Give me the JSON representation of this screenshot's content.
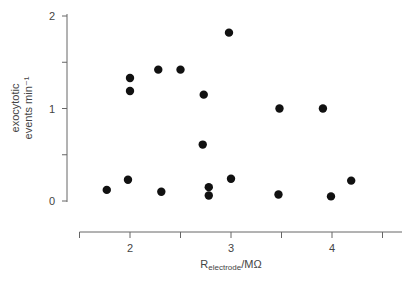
{
  "chart_data": {
    "type": "scatter",
    "title": "",
    "xlabel": "R_electrode/MΩ",
    "xlabel_main": "R",
    "xlabel_sub": "electrode",
    "xlabel_tail": "/MΩ",
    "ylabel": "exocytotic events min⁻¹",
    "ylabel_line1": "exocytotic",
    "ylabel_line2": "events min⁻¹",
    "xlim": [
      1.5,
      4.5
    ],
    "ylim": [
      0,
      2
    ],
    "x_ticks": [
      1.5,
      2,
      2.5,
      3,
      3.5,
      4,
      4.5
    ],
    "x_tick_labels": [
      "",
      "2",
      "",
      "3",
      "",
      "4",
      ""
    ],
    "y_ticks": [
      0,
      0.5,
      1,
      1.5,
      2
    ],
    "y_tick_labels": [
      "0",
      "",
      "1",
      "",
      "2"
    ],
    "grid": false,
    "legend": null,
    "series": [
      {
        "name": "cells",
        "color": "#111111",
        "points": [
          {
            "x": 1.77,
            "y": 0.12
          },
          {
            "x": 1.98,
            "y": 0.23
          },
          {
            "x": 2.0,
            "y": 1.33
          },
          {
            "x": 2.0,
            "y": 1.19
          },
          {
            "x": 2.28,
            "y": 1.42
          },
          {
            "x": 2.31,
            "y": 0.1
          },
          {
            "x": 2.5,
            "y": 1.42
          },
          {
            "x": 2.72,
            "y": 0.61
          },
          {
            "x": 2.73,
            "y": 1.15
          },
          {
            "x": 2.78,
            "y": 0.15
          },
          {
            "x": 2.78,
            "y": 0.06
          },
          {
            "x": 2.98,
            "y": 1.82
          },
          {
            "x": 3.0,
            "y": 0.24
          },
          {
            "x": 3.47,
            "y": 0.07
          },
          {
            "x": 3.48,
            "y": 1.0
          },
          {
            "x": 3.91,
            "y": 1.0
          },
          {
            "x": 3.99,
            "y": 0.05
          },
          {
            "x": 4.19,
            "y": 0.22
          }
        ]
      }
    ]
  }
}
